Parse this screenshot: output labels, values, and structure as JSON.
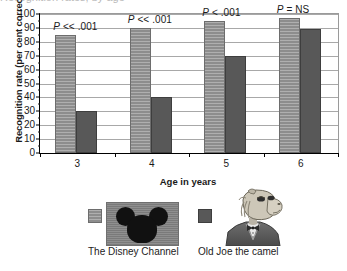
{
  "chart_data": {
    "type": "bar",
    "title": "",
    "xlabel": "Age in years",
    "ylabel": "Recognition rate (per cent correct)",
    "categories": [
      "3",
      "4",
      "5",
      "6"
    ],
    "ylim": [
      0,
      100
    ],
    "ytick_step": 10,
    "yticks": [
      "0",
      "10",
      "20",
      "30",
      "40",
      "50",
      "60",
      "70",
      "80",
      "90",
      "100"
    ],
    "grid": true,
    "legend_position": "bottom",
    "series": [
      {
        "name": "The Disney Channel",
        "color": "#8d8d8d",
        "values": [
          85,
          90,
          95,
          97
        ]
      },
      {
        "name": "Old Joe the camel",
        "color": "#585858",
        "values": [
          30,
          40,
          70,
          89
        ]
      }
    ],
    "annotations": [
      {
        "category": "3",
        "p_symbol": "P",
        "p_rest": " << .001"
      },
      {
        "category": "4",
        "p_symbol": "P",
        "p_rest": " << .001"
      },
      {
        "category": "5",
        "p_symbol": "P",
        "p_rest": " < .001"
      },
      {
        "category": "6",
        "p_symbol": "P",
        "p_rest": " = NS"
      }
    ]
  },
  "legend": {
    "entries": [
      {
        "label": "The Disney Channel",
        "swatch": "disney-bar-swatch",
        "image": "mickey-mouse-logo"
      },
      {
        "label": "Old Joe the camel",
        "swatch": "joe-bar-swatch",
        "image": "old-joe-camel-illustration"
      }
    ]
  },
  "top_cut_text": "Recognition rates, by age"
}
